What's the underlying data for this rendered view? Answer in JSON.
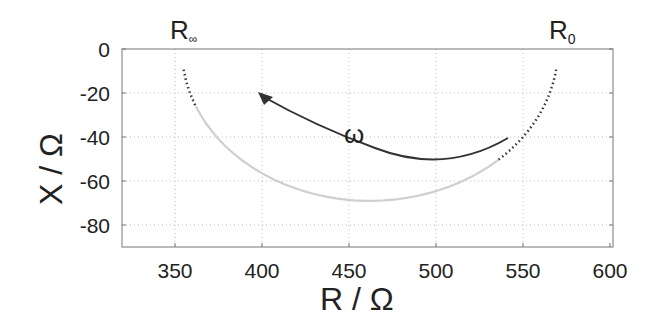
{
  "chart_data": {
    "type": "line",
    "title": "",
    "xlabel": "R / Ω",
    "ylabel": "X / Ω",
    "xlim": [
      320,
      600
    ],
    "ylim": [
      -90,
      0
    ],
    "xticks": [
      350,
      400,
      450,
      500,
      550,
      600
    ],
    "yticks": [
      0,
      -20,
      -40,
      -60,
      -80
    ],
    "grid": true,
    "series": [
      {
        "name": "Impedance semicircle",
        "type": "arc",
        "center_r": 462,
        "radius_r": 108,
        "min_x": -69,
        "color": "#c8c8c8",
        "style": "solid"
      },
      {
        "name": "High-frequency extrapolation",
        "r_range": [
          355,
          362
        ],
        "color": "#333333",
        "style": "dotted"
      },
      {
        "name": "Low-frequency extrapolation",
        "r_range": [
          536,
          569
        ],
        "color": "#333333",
        "style": "dotted"
      }
    ],
    "annotations": [
      {
        "text": "R∞",
        "base": "R",
        "sub": "∞",
        "r": 355,
        "x": 0
      },
      {
        "text": "R0",
        "base": "R",
        "sub": "0",
        "r": 569,
        "x": 0
      },
      {
        "text": "ω",
        "r": 452,
        "x": -38,
        "note": "arrow indicating increasing frequency, from (505,-40) to (394,-20)"
      }
    ]
  }
}
